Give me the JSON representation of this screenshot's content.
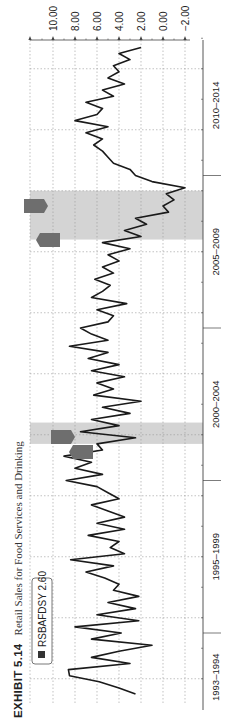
{
  "title": {
    "exhibit": "EXHIBIT 5.14",
    "text": "Retail Sales for Food Services and Drinking"
  },
  "legend": {
    "series_label": "RSBAFDSY",
    "value": "2.60",
    "swatch_color": "#333333"
  },
  "colors": {
    "line": "#1a1a1a",
    "recession": "#d4d4d4",
    "grid": "#999999",
    "axis": "#444444",
    "marker": "#6e6e6e"
  },
  "chart_data": {
    "type": "line",
    "orientation": "rotated 90° counter-clockwise (time runs bottom-to-top, value axis on top)",
    "title": "Retail Sales for Food Services and Drinking",
    "xlabel": "",
    "ylabel": "",
    "ylim": [
      -2,
      10
    ],
    "y_ticks": [
      "10.00",
      "8.00",
      "6.00",
      "4.00",
      "2.00",
      "0.00",
      "-2.00"
    ],
    "x_tick_labels": [
      "1993–1994",
      "1995–1999",
      "2000–2004",
      "2005–2009",
      "2010–2014"
    ],
    "grid": true,
    "legend": {
      "position": "bottom-left (top-left before rotation)",
      "entries": [
        "RSBAFDSY 2.60"
      ]
    },
    "recession_bands": [
      {
        "start": 2001.2,
        "end": 2001.9,
        "label": "REC"
      },
      {
        "start": 2007.9,
        "end": 2009.5,
        "label": "REC"
      }
    ],
    "series": [
      {
        "name": "RSBAFDSY",
        "unit": "% change, year over year",
        "x": [
          1993.0,
          1993.2,
          1993.4,
          1993.6,
          1993.8,
          1994.0,
          1994.2,
          1994.4,
          1994.6,
          1994.8,
          1995.0,
          1995.2,
          1995.4,
          1995.6,
          1995.8,
          1996.0,
          1996.2,
          1996.4,
          1996.6,
          1996.8,
          1997.0,
          1997.2,
          1997.4,
          1997.6,
          1997.8,
          1998.0,
          1998.2,
          1998.4,
          1998.6,
          1998.8,
          1999.0,
          1999.2,
          1999.4,
          1999.6,
          1999.8,
          2000.0,
          2000.2,
          2000.4,
          2000.6,
          2000.8,
          2001.0,
          2001.2,
          2001.4,
          2001.6,
          2001.8,
          2002.0,
          2002.2,
          2002.4,
          2002.6,
          2002.8,
          2003.0,
          2003.2,
          2003.4,
          2003.6,
          2003.8,
          2004.0,
          2004.2,
          2004.4,
          2004.6,
          2004.8,
          2005.0,
          2005.2,
          2005.4,
          2005.6,
          2005.8,
          2006.0,
          2006.2,
          2006.4,
          2006.6,
          2006.8,
          2007.0,
          2007.2,
          2007.4,
          2007.6,
          2007.8,
          2008.0,
          2008.2,
          2008.4,
          2008.6,
          2008.8,
          2009.0,
          2009.2,
          2009.4,
          2009.6,
          2009.8,
          2010.0,
          2010.2,
          2010.4,
          2010.6,
          2010.8,
          2011.0,
          2011.2,
          2011.4,
          2011.6,
          2011.8,
          2012.0,
          2012.2,
          2012.4,
          2012.6,
          2012.8,
          2013.0,
          2013.2,
          2013.4,
          2013.6,
          2013.8,
          2014.0,
          2014.2
        ],
        "values": [
          2.5,
          4.0,
          5.8,
          8.5,
          8.6,
          3.0,
          6.5,
          4.0,
          1.0,
          6.5,
          3.8,
          8.0,
          2.2,
          6.0,
          2.5,
          5.0,
          2.2,
          4.5,
          4.0,
          5.3,
          7.0,
          4.5,
          8.4,
          3.5,
          4.8,
          4.0,
          6.8,
          3.5,
          6.0,
          3.5,
          5.0,
          6.5,
          4.0,
          5.0,
          6.0,
          8.8,
          5.5,
          8.0,
          6.5,
          9.0,
          5.5,
          6.0,
          2.5,
          7.5,
          4.0,
          6.5,
          3.0,
          5.5,
          2.0,
          6.3,
          4.5,
          6.0,
          3.5,
          6.5,
          4.0,
          6.8,
          5.0,
          8.5,
          5.0,
          6.5,
          7.5,
          5.0,
          4.5,
          6.0,
          3.3,
          6.5,
          5.5,
          4.8,
          6.2,
          4.5,
          5.5,
          4.0,
          5.0,
          3.0,
          5.5,
          2.0,
          3.5,
          1.5,
          2.5,
          -0.5,
          0.0,
          -1.0,
          -0.3,
          -2.0,
          1.0,
          2.5,
          3.0,
          4.5,
          5.0,
          5.5,
          6.3,
          5.5,
          7.0,
          5.0,
          8.0,
          6.0,
          5.5,
          7.0,
          4.5,
          5.5,
          3.5,
          5.0,
          4.0,
          4.5,
          3.0,
          4.0,
          2.0
        ]
      }
    ]
  }
}
